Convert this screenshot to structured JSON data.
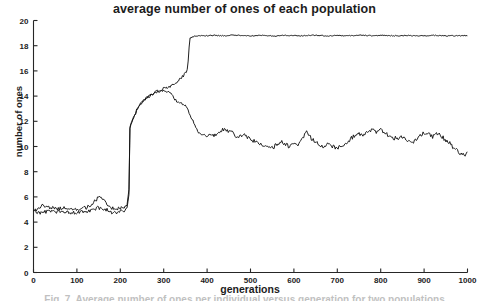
{
  "figure": {
    "title": "average number of ones of each population",
    "caption": "Fig. 7. Average number of ones per individual versus generation for two populations",
    "background_color": "#ffffff",
    "line_color": "#141414",
    "axis_color": "#262626"
  },
  "chart_data": {
    "type": "line",
    "title": "average number of ones of each population",
    "xlabel": "generations",
    "ylabel": "number of ones",
    "xlim": [
      0,
      1000
    ],
    "ylim": [
      0,
      20
    ],
    "xticks": [
      0,
      100,
      200,
      300,
      400,
      500,
      600,
      700,
      800,
      900,
      1000
    ],
    "yticks": [
      0,
      2,
      4,
      6,
      8,
      10,
      12,
      14,
      16,
      18,
      20
    ],
    "grid": false,
    "legend": "none",
    "series": [
      {
        "name": "population-1",
        "description": "rises from ~5 to a high plateau near 18.8 after generation 355",
        "x": [
          0,
          10,
          20,
          30,
          40,
          50,
          60,
          70,
          80,
          90,
          100,
          110,
          120,
          130,
          140,
          150,
          160,
          170,
          180,
          190,
          200,
          210,
          215,
          220,
          222,
          225,
          230,
          240,
          250,
          260,
          270,
          280,
          290,
          300,
          310,
          320,
          330,
          340,
          350,
          355,
          358,
          360,
          370,
          380,
          390,
          400,
          420,
          440,
          460,
          480,
          500,
          520,
          540,
          560,
          580,
          600,
          620,
          640,
          660,
          680,
          700,
          720,
          740,
          760,
          780,
          800,
          820,
          840,
          860,
          880,
          900,
          920,
          940,
          960,
          980,
          1000
        ],
        "values": [
          5.0,
          5.05,
          5.35,
          5.2,
          5.1,
          5.15,
          5.05,
          5.1,
          5.0,
          4.95,
          5.05,
          5.0,
          5.15,
          5.25,
          5.6,
          5.95,
          5.85,
          5.3,
          5.15,
          5.05,
          5.1,
          5.2,
          5.25,
          6.6,
          11.4,
          11.8,
          12.2,
          13.0,
          13.5,
          13.8,
          14.0,
          14.25,
          14.4,
          14.6,
          14.7,
          14.85,
          15.1,
          15.4,
          15.8,
          16.1,
          17.6,
          18.6,
          18.75,
          18.8,
          18.78,
          18.8,
          18.82,
          18.78,
          18.85,
          18.8,
          18.78,
          18.82,
          18.8,
          18.76,
          18.82,
          18.8,
          18.78,
          18.84,
          18.8,
          18.78,
          18.82,
          18.78,
          18.8,
          18.84,
          18.78,
          18.82,
          18.8,
          18.78,
          18.82,
          18.8,
          18.78,
          18.82,
          18.8,
          18.78,
          18.8,
          18.8
        ]
      },
      {
        "name": "population-2",
        "description": "rises with the first, then falls back to fluctuate around 10",
        "x": [
          0,
          10,
          20,
          30,
          40,
          50,
          60,
          70,
          80,
          90,
          100,
          110,
          120,
          130,
          140,
          150,
          160,
          170,
          180,
          190,
          200,
          210,
          215,
          220,
          222,
          225,
          230,
          240,
          250,
          260,
          270,
          280,
          290,
          300,
          310,
          315,
          320,
          330,
          340,
          350,
          360,
          370,
          380,
          390,
          400,
          410,
          420,
          430,
          440,
          450,
          460,
          470,
          480,
          490,
          500,
          510,
          520,
          530,
          540,
          550,
          560,
          570,
          580,
          590,
          600,
          610,
          620,
          630,
          640,
          650,
          660,
          670,
          680,
          690,
          700,
          710,
          720,
          730,
          740,
          750,
          760,
          770,
          780,
          790,
          800,
          810,
          820,
          830,
          840,
          850,
          860,
          870,
          880,
          890,
          900,
          910,
          920,
          930,
          940,
          950,
          960,
          970,
          980,
          990,
          1000
        ],
        "values": [
          4.95,
          4.75,
          4.7,
          4.85,
          4.9,
          4.8,
          4.85,
          4.75,
          4.8,
          4.7,
          4.8,
          4.85,
          4.75,
          4.85,
          5.0,
          5.15,
          5.05,
          4.95,
          4.7,
          4.75,
          4.8,
          4.9,
          5.0,
          6.2,
          11.5,
          11.9,
          12.3,
          13.1,
          13.6,
          13.9,
          14.1,
          14.35,
          14.5,
          14.45,
          14.3,
          14.35,
          14.0,
          13.6,
          13.4,
          13.2,
          12.6,
          11.8,
          11.1,
          10.9,
          10.8,
          11.0,
          10.85,
          11.1,
          11.45,
          11.2,
          11.05,
          10.7,
          10.95,
          10.85,
          10.6,
          10.4,
          10.15,
          10.05,
          9.95,
          9.85,
          10.15,
          10.45,
          10.2,
          10.0,
          10.35,
          10.1,
          10.6,
          11.2,
          10.6,
          10.35,
          10.1,
          9.95,
          10.25,
          10.0,
          9.85,
          10.05,
          10.25,
          10.6,
          10.85,
          11.0,
          10.85,
          11.1,
          11.3,
          11.15,
          11.4,
          11.1,
          10.85,
          10.7,
          10.6,
          10.75,
          10.5,
          10.3,
          10.5,
          10.8,
          11.1,
          11.0,
          10.8,
          11.05,
          10.85,
          10.5,
          10.2,
          9.85,
          9.5,
          9.35,
          9.4
        ]
      }
    ]
  }
}
